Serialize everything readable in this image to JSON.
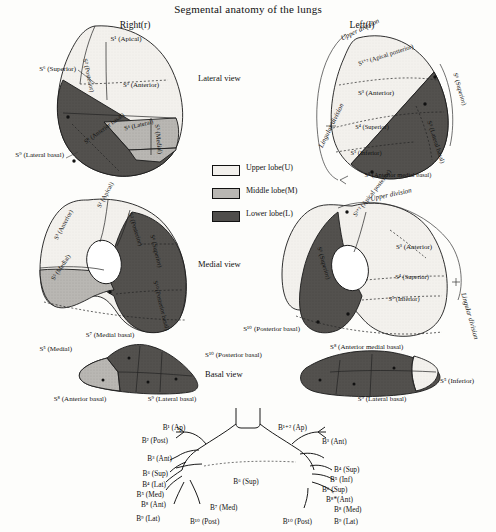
{
  "title": "Segmental anatomy of the lungs",
  "sides": {
    "right": "Right(r)",
    "left": "Left(l)"
  },
  "views": {
    "lateral": "Lateral view",
    "medial": "Medial view",
    "basal": "Basal view"
  },
  "legend": {
    "items": [
      {
        "key": "upper",
        "label": "Upper lobe(U)",
        "color": "#f2f0ec"
      },
      {
        "key": "middle",
        "label": "Middle lobe(M)",
        "color": "#b9b7b3"
      },
      {
        "key": "lower",
        "label": "Lower lobe(L)",
        "color": "#4f4d4b"
      }
    ]
  },
  "divisions": {
    "upper_division": "Upper division",
    "lingular_division": "Lingular division"
  },
  "right_lateral": {
    "s1": "S¹ (Apical)",
    "s2": "S² (Posterior)",
    "s3": "S³ (Anterior)",
    "s4": "S⁴ (Lateral)",
    "s5": "S⁵ (Medial)",
    "s6": "S⁶ (Superior)",
    "s8": "S⁸ (Anterior basal)",
    "s9": "S⁹ (Lateral basal)"
  },
  "left_lateral": {
    "s12": "S¹⁺² (Apical posterior)",
    "s3": "S³ (Anterior)",
    "s4": "S⁴ (Superior)",
    "s5": "S⁵ (Inferior)",
    "s6": "S⁶ (Superior)",
    "s8": "S⁸ (Anterior medial basal)",
    "s9": "S⁹ (Lateral basal)"
  },
  "right_medial": {
    "s1": "S¹ (Apical)",
    "s2": "S² (Posterior)",
    "s3": "S³ (Anterior)",
    "s5": "S⁵ (Medial)",
    "s6": "S⁶ (Superior)",
    "s7": "S⁷ (Medial basal)",
    "s10": "S¹⁰ (Posterior basal)"
  },
  "left_medial": {
    "s12": "S¹⁺² (Apical posterior)",
    "s3": "S³ (Anterior)",
    "s4": "S⁴ (Superior)",
    "s5": "S⁵ (Inferior)",
    "s6": "S⁶ (Superior)",
    "s8": "S⁸ (Anterior medial basal)",
    "s10": "S¹⁰ (Posterior basal)"
  },
  "right_basal": {
    "s5": "S⁵ (Medial)",
    "s7": "S⁷ (Medial basal)",
    "s8": "S⁸ (Anterior basal)",
    "s9": "S⁹ (Lateral basal)",
    "s10": "S¹⁰ (Posterior basal)"
  },
  "left_basal": {
    "s5": "S⁵ (Inferior)",
    "s8": "S⁸ (Anterior medial basal)",
    "s9": "S⁹ (Lateral basal)",
    "s10": "S¹⁰ (Posterior basal)"
  },
  "bronchial_tree": {
    "right": [
      "B¹ (Ap)",
      "B² (Post)",
      "B³ (Ant)",
      "B⁶ (Sup)",
      "B⁴ (Lat)",
      "B⁵ (Med)",
      "B⁸ (Ant)",
      "B⁹ (Lat)",
      "B¹⁰ (Post)",
      "B⁷ (Med)"
    ],
    "left": [
      "B¹⁺² (Ap)",
      "B³ (Ant)",
      "B⁴ (Sup)",
      "B⁵ (Inf)",
      "B⁶ (Sup)",
      "B⁸*(Ant)",
      "B⁸ (Med)",
      "B⁹ (Lat)",
      "B¹⁰ (Post)"
    ]
  }
}
